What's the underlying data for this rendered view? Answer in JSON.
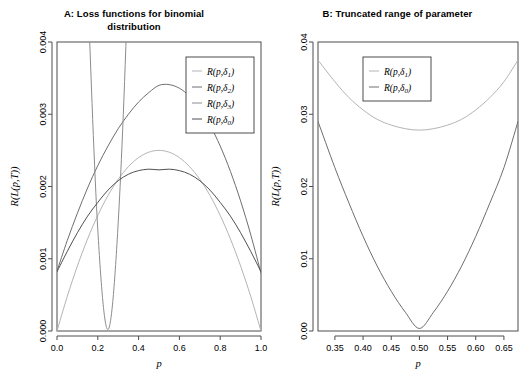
{
  "figure": {
    "width": 527,
    "height": 387,
    "background": "#ffffff"
  },
  "panel_a": {
    "title_line1": "A: Loss functions for binomial",
    "title_line2": "distribution",
    "xlabel": "p",
    "ylabel": "R(L(p,T))",
    "xticks": [
      "0.0",
      "0.2",
      "0.4",
      "0.6",
      "0.8",
      "1.0"
    ],
    "yticks": [
      "0.000",
      "0.001",
      "0.002",
      "0.003",
      "0.004"
    ],
    "legend": [
      {
        "label_main": "R(p,δ",
        "label_sub": "1",
        "label_end": ")",
        "color": "#b4b4b4"
      },
      {
        "label_main": "R(p,δ",
        "label_sub": "2",
        "label_end": ")",
        "color": "#6e6e6e"
      },
      {
        "label_main": "R(p,δ",
        "label_sub": "3",
        "label_end": ")",
        "color": "#8c8c8c"
      },
      {
        "label_main": "R(p,δ",
        "label_sub": "0",
        "label_end": ")",
        "color": "#505050"
      }
    ]
  },
  "panel_b": {
    "title_line1": "B: Truncated range of parameter",
    "title_line2": "",
    "xlabel": "p",
    "ylabel": "R(L(p,T))",
    "xticks": [
      "0.35",
      "0.40",
      "0.45",
      "0.50",
      "0.55",
      "0.60",
      "0.65"
    ],
    "yticks": [
      "0.00",
      "0.01",
      "0.02",
      "0.03",
      "0.04"
    ],
    "legend": [
      {
        "label_main": "R(p,δ",
        "label_sub": "1",
        "label_end": ")",
        "color": "#b4b4b4"
      },
      {
        "label_main": "R(p,δ",
        "label_sub": "0",
        "label_end": ")",
        "color": "#6e6e6e"
      }
    ]
  },
  "chart_data": [
    {
      "type": "line",
      "panel": "A",
      "title": "A: Loss functions for binomial distribution",
      "xlabel": "p",
      "ylabel": "R(L(p,T))",
      "xlim": [
        0.0,
        1.0
      ],
      "ylim": [
        0.0,
        0.004
      ],
      "grid": false,
      "legend_position": "top-right",
      "x": [
        0.0,
        0.05,
        0.1,
        0.15,
        0.2,
        0.25,
        0.3,
        0.35,
        0.4,
        0.45,
        0.5,
        0.55,
        0.6,
        0.65,
        0.7,
        0.75,
        0.8,
        0.85,
        0.9,
        0.95,
        1.0
      ],
      "series": [
        {
          "name": "R(p,δ1)",
          "color": "#b4b4b4",
          "values": [
            0.0,
            0.000475,
            0.0009,
            0.001275,
            0.0016,
            0.001875,
            0.0021,
            0.002275,
            0.0024,
            0.002475,
            0.0025,
            0.002475,
            0.0024,
            0.002275,
            0.0021,
            0.001875,
            0.0016,
            0.001275,
            0.0009,
            0.000475,
            0.0
          ]
        },
        {
          "name": "R(p,δ2)",
          "color": "#6e6e6e",
          "values": [
            0.00083,
            0.00125,
            0.00163,
            0.00198,
            0.00229,
            0.00256,
            0.0028,
            0.003,
            0.00317,
            0.0033,
            0.0034,
            0.00341,
            0.00336,
            0.00325,
            0.00308,
            0.00285,
            0.00256,
            0.00221,
            0.0018,
            0.00133,
            0.0008
          ]
        },
        {
          "name": "R(p,δ3)",
          "color": "#8c8c8c",
          "values": [
            0.022,
            0.0145,
            0.009,
            0.0048,
            0.0014,
            2e-05,
            0.0015,
            0.005,
            0.0105,
            0.0175,
            0.026,
            0.036,
            0.0475,
            0.0605,
            0.075,
            0.091,
            0.1085,
            0.1275,
            0.148,
            0.17,
            0.1935
          ]
        },
        {
          "name": "R(p,δ0)",
          "color": "#505050",
          "values": [
            0.00082,
            0.0011,
            0.00136,
            0.00159,
            0.00178,
            0.00195,
            0.00208,
            0.00217,
            0.00222,
            0.00224,
            0.00223,
            0.00224,
            0.00222,
            0.00217,
            0.00208,
            0.00195,
            0.00178,
            0.00159,
            0.00136,
            0.0011,
            0.00082
          ]
        }
      ],
      "annotations": [
        "R(p,δ3) descends from above the top of the panel, touches ~0 near p=0.25, then rises off the top again",
        "R(p,δ1) is a symmetric arch from 0 at p=0 to 0 at p=1 with peak 0.0025 at p=0.5",
        "R(p,δ2) peaks near 0.0034 slightly right of p=0.5",
        "R(p,δ0) is a flat symmetric arch peaking near 0.00225 at p=0.5"
      ]
    },
    {
      "type": "line",
      "panel": "B",
      "title": "B: Truncated range of parameter",
      "xlabel": "p",
      "ylabel": "R(L(p,T))",
      "xlim": [
        0.32,
        0.675
      ],
      "ylim": [
        0.0,
        0.04
      ],
      "grid": false,
      "legend_position": "top-center",
      "x": [
        0.32,
        0.35,
        0.375,
        0.4,
        0.425,
        0.45,
        0.475,
        0.5,
        0.525,
        0.55,
        0.575,
        0.6,
        0.625,
        0.65,
        0.675
      ],
      "series": [
        {
          "name": "R(p,δ1)",
          "color": "#b4b4b4",
          "values": [
            0.0375,
            0.0345,
            0.0323,
            0.0306,
            0.0293,
            0.0285,
            0.028,
            0.0278,
            0.028,
            0.0285,
            0.0293,
            0.0306,
            0.0323,
            0.0345,
            0.0375
          ]
        },
        {
          "name": "R(p,δ0)",
          "color": "#6e6e6e",
          "values": [
            0.029,
            0.0226,
            0.0177,
            0.0131,
            0.009,
            0.0055,
            0.0026,
            0.00035,
            0.0026,
            0.0055,
            0.009,
            0.0131,
            0.0177,
            0.0226,
            0.029
          ]
        }
      ],
      "annotations": [
        "Both curves are symmetric parabolas about p = 0.50",
        "R(p,δ1) has minimum ~0.0278 at p = 0.50",
        "R(p,δ0) has minimum ~0.000 at p = 0.50"
      ]
    }
  ]
}
